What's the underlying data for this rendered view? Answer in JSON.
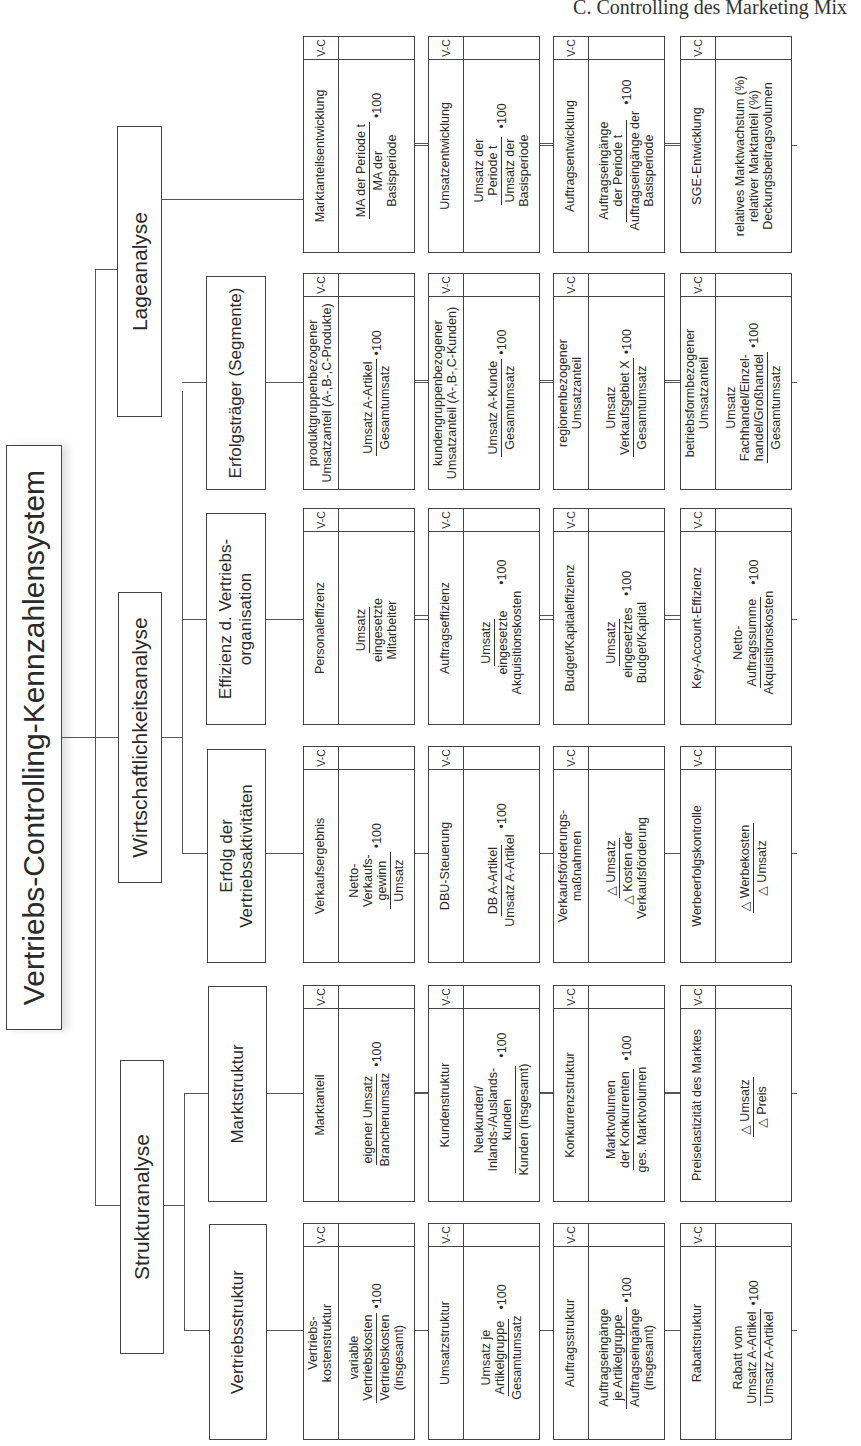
{
  "header": "C. Controlling des Marketing Mix",
  "root": "Vertriebs-Controlling-Kennzahlensystem",
  "level1": [
    {
      "label": "Strukturanalyse"
    },
    {
      "label": "Wirtschaftlichkeitsanalyse"
    },
    {
      "label": "Lageanalyse"
    }
  ],
  "level2": [
    {
      "label": "Vertriebsstruktur"
    },
    {
      "label": "Marktstruktur"
    },
    {
      "label": "Erfolg der Vertriebsaktivitäten"
    },
    {
      "label": "Effizienz d. Vertriebs-organisation"
    },
    {
      "label": "Erfolgsträger (Segmente)"
    }
  ],
  "vc_label": "V-C",
  "groups": [
    {
      "parent": "Vertriebsstruktur",
      "cards": [
        {
          "name": "Vertriebs-\nkostenstruktur",
          "num": "variable\nVertriebskosten",
          "den": "Vertriebskosten\n(insgesamt)",
          "mult": "•100"
        },
        {
          "name": "Umsatzstruktur",
          "num": "Umsatz je\nArtikelgruppe",
          "den": "Gesamtumsatz",
          "mult": "•100"
        },
        {
          "name": "Auftragsstruktur",
          "num": "Auftragseingänge\nje Artikelgruppe",
          "den": "Auftragseingänge\n(insgesamt)",
          "mult": "•100"
        },
        {
          "name": "Rabattstruktur",
          "num": "Rabatt vom\nUmsatz A-Artikel",
          "den": "Umsatz A-Artikel",
          "mult": "•100"
        }
      ]
    },
    {
      "parent": "Marktstruktur",
      "cards": [
        {
          "name": "Marktanteil",
          "num": "eigener Umsatz",
          "den": "Branchenumsatz",
          "mult": "•100"
        },
        {
          "name": "Kundenstruktur",
          "num": "Neukunden/\nInlands-/Auslands-\nkunden",
          "den": "Kunden (insgesamt)",
          "mult": "•100"
        },
        {
          "name": "Konkurrenzstruktur",
          "num": "Marktvolumen\nder Konkurrenten",
          "den": "ges. Marktvolumen",
          "mult": "•100"
        },
        {
          "name": "Preiselastizität des Marktes",
          "num": "△ Umsatz",
          "den": "△ Preis",
          "mult": ""
        }
      ]
    },
    {
      "parent": "Erfolg der Vertriebsaktivitäten",
      "cards": [
        {
          "name": "Verkaufsergebnis",
          "num": "Netto-\nVerkaufs-\ngewinn",
          "den": "Umsatz",
          "mult": "•100"
        },
        {
          "name": "DBU-Steuerung",
          "num": "DB A-Artikel",
          "den": "Umsatz A-Artikel",
          "mult": "•100"
        },
        {
          "name": "Verkaufsförderungs-\nmaßnahmen",
          "num": "△ Umsatz",
          "den": "△ Kosten der\nVerkaufsförderung",
          "mult": ""
        },
        {
          "name": "Werbeerfolgskontrolle",
          "num": "△ Werbekosten",
          "den": "△ Umsatz",
          "mult": ""
        }
      ]
    },
    {
      "parent": "Effizienz d. Vertriebsorganisation",
      "cards": [
        {
          "name": "Personaleffizenz",
          "num": "Umsatz",
          "den": "eingesetzte\nMitarbeiter",
          "mult": ""
        },
        {
          "name": "Auftragseffizienz",
          "num": "Umsatz",
          "den": "eingesetzte\nAkquisitionskosten",
          "mult": "•100"
        },
        {
          "name": "Budget/Kapitaleffizienz",
          "num": "Umsatz",
          "den": "eingesetztes\nBudget/Kapital",
          "mult": "•100"
        },
        {
          "name": "Key-Account-Effizienz",
          "num": "Netto-\nAuftragssumme",
          "den": "Akquisitionskosten",
          "mult": "•100"
        }
      ]
    },
    {
      "parent": "Erfolgsträger (Segmente)",
      "cards": [
        {
          "name": "produktgruppenbezogener\nUmsatzanteil (A-,B-,C-Produkte)",
          "num": "Umsatz A-Artikel",
          "den": "Gesamtumsatz",
          "mult": "•100"
        },
        {
          "name": "kundengruppenbezogener\nUmsatzanteil (A-,B-,C-Kunden)",
          "num": "Umsatz A-Kunde",
          "den": "Gesamtumsatz",
          "mult": "•100"
        },
        {
          "name": "regionenbezogener\nUmsatzanteil",
          "num": "Umsatz\nVerkaufsgebiet X",
          "den": "Gesamtumsatz",
          "mult": "•100"
        },
        {
          "name": "betriebsformbezogener\nUmsatzanteil",
          "num": "Umsatz\nFachhandel/Einzel-\nhandel/Großhandel",
          "den": "Gesamtumsatz",
          "mult": "•100"
        }
      ]
    },
    {
      "parent": "Lageanalyse",
      "cards": [
        {
          "name": "Marktanteilsentwicklung",
          "num": "MA der Periode t",
          "den": "MA der\nBasisperiode",
          "mult": "•100"
        },
        {
          "name": "Umsatzentwicklung",
          "num": "Umsatz der\nPeriode t",
          "den": "Umsatz der\nBasisperiode",
          "mult": "•100"
        },
        {
          "name": "Auftragsentwicklung",
          "num": "Auftragseingänge\nder Periode t",
          "den": "Auftragseingänge der\nBasisperiode",
          "mult": "•100"
        },
        {
          "name": "SGE-Entwicklung",
          "plain": "relatives Marktwachstum (%)\nrelativer Marktanteil (%)\nDeckungsbeitragsvolumen"
        }
      ]
    }
  ]
}
